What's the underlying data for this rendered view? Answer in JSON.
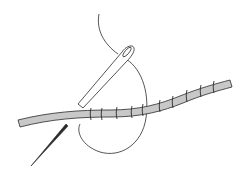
{
  "illustration": {
    "subject": "needle sewing a whip stitch around a rod",
    "colors": {
      "background": "#ffffff",
      "line": "#2a2a2a",
      "rod_fill": "#c8c8c8",
      "needle_fill": "#ffffff"
    },
    "stitch_count": 11
  }
}
